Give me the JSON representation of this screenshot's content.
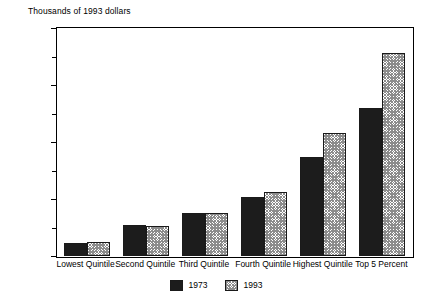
{
  "chart_data": {
    "type": "bar",
    "title": "",
    "ylabel": "Thousands of 1993 dollars",
    "xlabel": "",
    "ylim": [
      0,
      200
    ],
    "y_major_ticks": [
      0,
      50,
      100,
      150,
      200
    ],
    "y_minor_ticks": [
      25,
      75,
      125,
      175
    ],
    "y_tick_labels": [
      "0",
      "50",
      "100",
      "150",
      "200"
    ],
    "grid": false,
    "legend_position": "bottom-center",
    "categories": [
      "Lowest Quintile",
      "Second Quintile",
      "Third Quintile",
      "Fourth Quintile",
      "Highest Quintile",
      "Top 5 Percent"
    ],
    "series": [
      {
        "name": "1973",
        "fill": "solid-black",
        "color": "#1c1c1c",
        "values": [
          11,
          27,
          38,
          52,
          87,
          130
        ]
      },
      {
        "name": "1993",
        "fill": "crosshatch",
        "color": "#8c8c8c",
        "values": [
          12,
          26,
          38,
          56,
          108,
          178
        ]
      }
    ]
  },
  "legend": {
    "entries": [
      {
        "label": "1973"
      },
      {
        "label": "1993"
      }
    ]
  }
}
